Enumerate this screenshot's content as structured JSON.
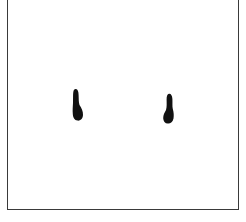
{
  "figure": {
    "background": "#ffffff",
    "frame_color": "#3a3a3a",
    "ink_color": "#111111",
    "blobs": [
      {
        "label": "left-spot",
        "x": 72,
        "y": 89,
        "width": 12,
        "height": 32
      },
      {
        "label": "right-spot",
        "x": 163,
        "y": 93,
        "width": 12,
        "height": 31
      }
    ]
  }
}
